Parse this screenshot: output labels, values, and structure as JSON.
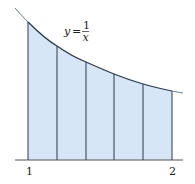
{
  "diagram": {
    "function_label": {
      "lhs": "y",
      "equals": "=",
      "numerator": "1",
      "denominator": "x"
    },
    "x_ticks": [
      {
        "value": 1,
        "label": "1"
      },
      {
        "value": 2,
        "label": "2"
      }
    ],
    "interval": [
      1,
      2
    ],
    "num_strips": 5,
    "strip_boundaries": [
      1.0,
      1.2,
      1.4,
      1.6,
      1.8,
      2.0
    ],
    "colors": {
      "fill": "#d6e6f7",
      "lines": "#2b3a4a",
      "curve": "#3a4a5c",
      "axis": "#555555"
    }
  }
}
